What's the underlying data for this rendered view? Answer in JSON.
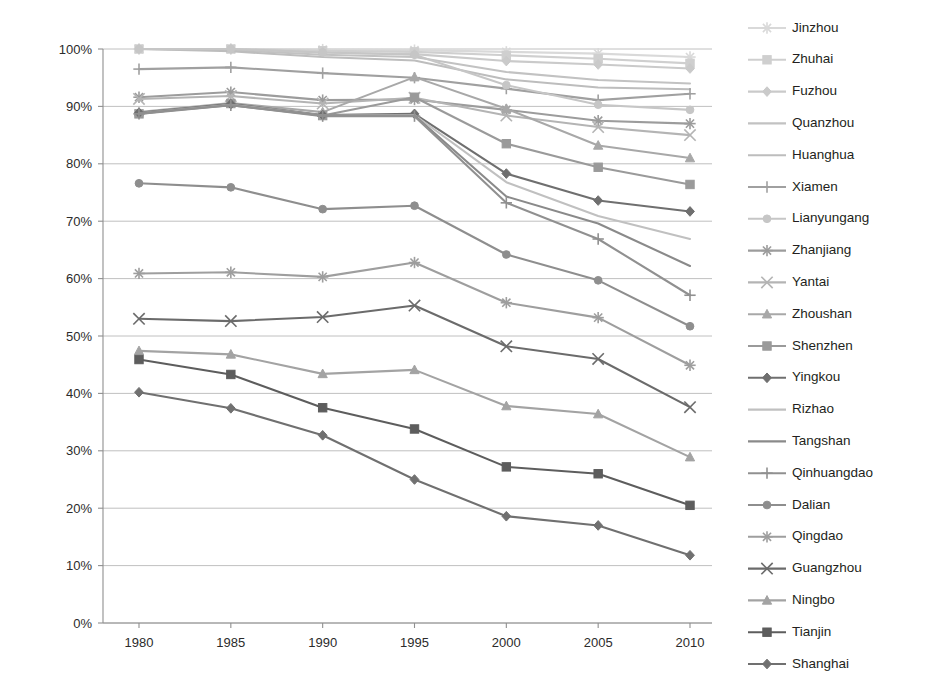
{
  "chart_data": {
    "type": "line",
    "title": "",
    "xlabel": "",
    "ylabel": "",
    "x": [
      1980,
      1985,
      1990,
      1995,
      2000,
      2005,
      2010
    ],
    "categories": [
      "1980",
      "1985",
      "1990",
      "1995",
      "2000",
      "2005",
      "2010"
    ],
    "ylim": [
      0,
      100
    ],
    "ytick_labels": [
      "0%",
      "10%",
      "20%",
      "30%",
      "40%",
      "50%",
      "60%",
      "70%",
      "80%",
      "90%",
      "100%"
    ],
    "ytick_values": [
      0,
      10,
      20,
      30,
      40,
      50,
      60,
      70,
      80,
      90,
      100
    ],
    "grid": true,
    "legend_position": "right",
    "units": "percent",
    "series": [
      {
        "name": "Jinzhou",
        "marker": "asterisk",
        "color": "#d9d9d9",
        "values": [
          100.0,
          100.0,
          99.9,
          99.8,
          99.5,
          99.2,
          98.6
        ]
      },
      {
        "name": "Zhuhai",
        "marker": "square",
        "color": "#cfcfcf",
        "values": [
          100.0,
          100.0,
          99.7,
          99.5,
          98.9,
          98.3,
          97.5
        ]
      },
      {
        "name": "Fuzhou",
        "marker": "diamond",
        "color": "#cacaca",
        "values": [
          100.0,
          100.0,
          99.4,
          99.1,
          97.9,
          97.3,
          96.6
        ]
      },
      {
        "name": "Quanzhou",
        "marker": "none",
        "color": "#c2c2c2",
        "values": [
          100.0,
          99.8,
          99.0,
          98.6,
          96.0,
          94.6,
          94.0
        ]
      },
      {
        "name": "Huanghua",
        "marker": "none",
        "color": "#bdbdbd",
        "values": [
          100.0,
          99.6,
          98.6,
          98.0,
          94.7,
          93.3,
          93.0
        ]
      },
      {
        "name": "Xiamen",
        "marker": "plus",
        "color": "#a0a0a0",
        "values": [
          96.5,
          96.8,
          95.8,
          95.0,
          93.1,
          91.1,
          92.2
        ]
      },
      {
        "name": "Lianyungang",
        "marker": "circle",
        "color": "#c6c6c6",
        "values": [
          100.0,
          100.0,
          99.4,
          99.0,
          93.7,
          90.3,
          89.4
        ]
      },
      {
        "name": "Zhanjiang",
        "marker": "asterisk",
        "color": "#9c9c9c",
        "values": [
          91.6,
          92.5,
          91.1,
          91.2,
          89.4,
          87.5,
          87.0
        ]
      },
      {
        "name": "Yantai",
        "marker": "x",
        "color": "#b4b4b4",
        "values": [
          91.3,
          91.8,
          90.5,
          91.5,
          88.4,
          86.4,
          85.0
        ]
      },
      {
        "name": "Zhoushan",
        "marker": "triangle",
        "color": "#a8a8a8",
        "values": [
          89.0,
          90.6,
          89.0,
          95.1,
          89.6,
          83.2,
          81.0
        ]
      },
      {
        "name": "Shenzhen",
        "marker": "square",
        "color": "#9a9a9a",
        "values": [
          88.7,
          90.5,
          88.4,
          91.6,
          83.5,
          79.4,
          76.4
        ]
      },
      {
        "name": "Yingkou",
        "marker": "diamond",
        "color": "#6f6f6f",
        "values": [
          88.9,
          90.4,
          88.5,
          88.7,
          78.3,
          73.6,
          71.7
        ]
      },
      {
        "name": "Rizhao",
        "marker": "none",
        "color": "#c0c0c0",
        "values": [
          88.8,
          90.3,
          88.4,
          88.5,
          76.8,
          70.9,
          66.9
        ]
      },
      {
        "name": "Tangshan",
        "marker": "none",
        "color": "#8a8a8a",
        "values": [
          88.8,
          90.2,
          88.4,
          88.4,
          74.3,
          69.6,
          62.2
        ]
      },
      {
        "name": "Qinhuangdao",
        "marker": "plus",
        "color": "#909090",
        "values": [
          88.7,
          90.2,
          88.3,
          88.3,
          73.2,
          66.9,
          57.1
        ]
      },
      {
        "name": "Dalian",
        "marker": "circle",
        "color": "#8e8e8e",
        "values": [
          76.6,
          75.9,
          72.1,
          72.7,
          64.2,
          59.7,
          51.7
        ]
      },
      {
        "name": "Qingdao",
        "marker": "asterisk",
        "color": "#9e9e9e",
        "values": [
          60.9,
          61.1,
          60.3,
          62.8,
          55.8,
          53.2,
          44.9
        ]
      },
      {
        "name": "Guangzhou",
        "marker": "x",
        "color": "#6b6b6b",
        "values": [
          53.0,
          52.6,
          53.3,
          55.3,
          48.2,
          46.0,
          37.6
        ]
      },
      {
        "name": "Ningbo",
        "marker": "triangle",
        "color": "#a3a3a3",
        "values": [
          47.4,
          46.8,
          43.4,
          44.1,
          37.8,
          36.4,
          28.9
        ]
      },
      {
        "name": "Tianjin",
        "marker": "square",
        "color": "#5d5d5d",
        "values": [
          45.9,
          43.3,
          37.5,
          33.8,
          27.2,
          26.0,
          20.5
        ]
      },
      {
        "name": "Shanghai",
        "marker": "diamond",
        "color": "#707070",
        "values": [
          40.2,
          37.4,
          32.7,
          25.0,
          18.6,
          17.0,
          11.8
        ]
      }
    ],
    "legend_entries": [
      {
        "label": "Jinzhou",
        "marker": "asterisk",
        "color": "#d9d9d9"
      },
      {
        "label": "Zhuhai",
        "marker": "square",
        "color": "#cfcfcf"
      },
      {
        "label": "Fuzhou",
        "marker": "diamond",
        "color": "#cacaca"
      },
      {
        "label": "Quanzhou",
        "marker": "none",
        "color": "#c2c2c2"
      },
      {
        "label": "Huanghua",
        "marker": "none",
        "color": "#bdbdbd"
      },
      {
        "label": "Xiamen",
        "marker": "plus",
        "color": "#a0a0a0"
      },
      {
        "label": "Lianyungang",
        "marker": "circle",
        "color": "#c6c6c6"
      },
      {
        "label": "Zhanjiang",
        "marker": "asterisk",
        "color": "#9c9c9c"
      },
      {
        "label": "Yantai",
        "marker": "x",
        "color": "#b4b4b4"
      },
      {
        "label": "Zhoushan",
        "marker": "triangle",
        "color": "#a8a8a8"
      },
      {
        "label": "Shenzhen",
        "marker": "square",
        "color": "#9a9a9a"
      },
      {
        "label": "Yingkou",
        "marker": "diamond",
        "color": "#6f6f6f"
      },
      {
        "label": "Rizhao",
        "marker": "none",
        "color": "#c0c0c0"
      },
      {
        "label": "Tangshan",
        "marker": "none",
        "color": "#8a8a8a"
      },
      {
        "label": "Qinhuangdao",
        "marker": "plus",
        "color": "#909090"
      },
      {
        "label": "Dalian",
        "marker": "circle",
        "color": "#8e8e8e"
      },
      {
        "label": "Qingdao",
        "marker": "asterisk",
        "color": "#9e9e9e"
      },
      {
        "label": "Guangzhou",
        "marker": "x",
        "color": "#6b6b6b"
      },
      {
        "label": "Ningbo",
        "marker": "triangle",
        "color": "#a3a3a3"
      },
      {
        "label": "Tianjin",
        "marker": "square",
        "color": "#5d5d5d"
      },
      {
        "label": "Shanghai",
        "marker": "diamond",
        "color": "#707070"
      }
    ]
  },
  "colors": {
    "background": "#ffffff",
    "gridline": "#b9b9b9",
    "axis": "#8f8f8f",
    "text": "#231f20"
  }
}
